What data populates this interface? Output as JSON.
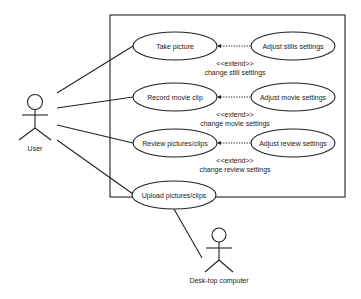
{
  "diagram": {
    "type": "uml-use-case",
    "actors": [
      {
        "id": "user",
        "label": "User"
      },
      {
        "id": "desktop",
        "label": "Desk-top computer"
      }
    ],
    "use_cases": [
      {
        "id": "take_picture",
        "label": "Take picture"
      },
      {
        "id": "record_movie",
        "label": "Record movie clip"
      },
      {
        "id": "review",
        "label": "Review pictures/clips"
      },
      {
        "id": "upload",
        "label": "Upload pictures/clips"
      },
      {
        "id": "adjust_stills",
        "label": "Adjust stills settings"
      },
      {
        "id": "adjust_movie",
        "label": "Adjust movie settings"
      },
      {
        "id": "adjust_review",
        "label": "Adjust review settings"
      }
    ],
    "extends": [
      {
        "from": "adjust_stills",
        "to": "take_picture",
        "stereotype": "<<extend>>",
        "condition": "change still settings"
      },
      {
        "from": "adjust_movie",
        "to": "record_movie",
        "stereotype": "<<extend>>",
        "condition": "change movie settings"
      },
      {
        "from": "adjust_review",
        "to": "review",
        "stereotype": "<<extend>>",
        "condition": "change review settings"
      }
    ],
    "associations": [
      {
        "actor": "user",
        "use_case": "take_picture"
      },
      {
        "actor": "user",
        "use_case": "record_movie"
      },
      {
        "actor": "user",
        "use_case": "review"
      },
      {
        "actor": "user",
        "use_case": "upload"
      },
      {
        "actor": "desktop",
        "use_case": "upload"
      }
    ]
  }
}
